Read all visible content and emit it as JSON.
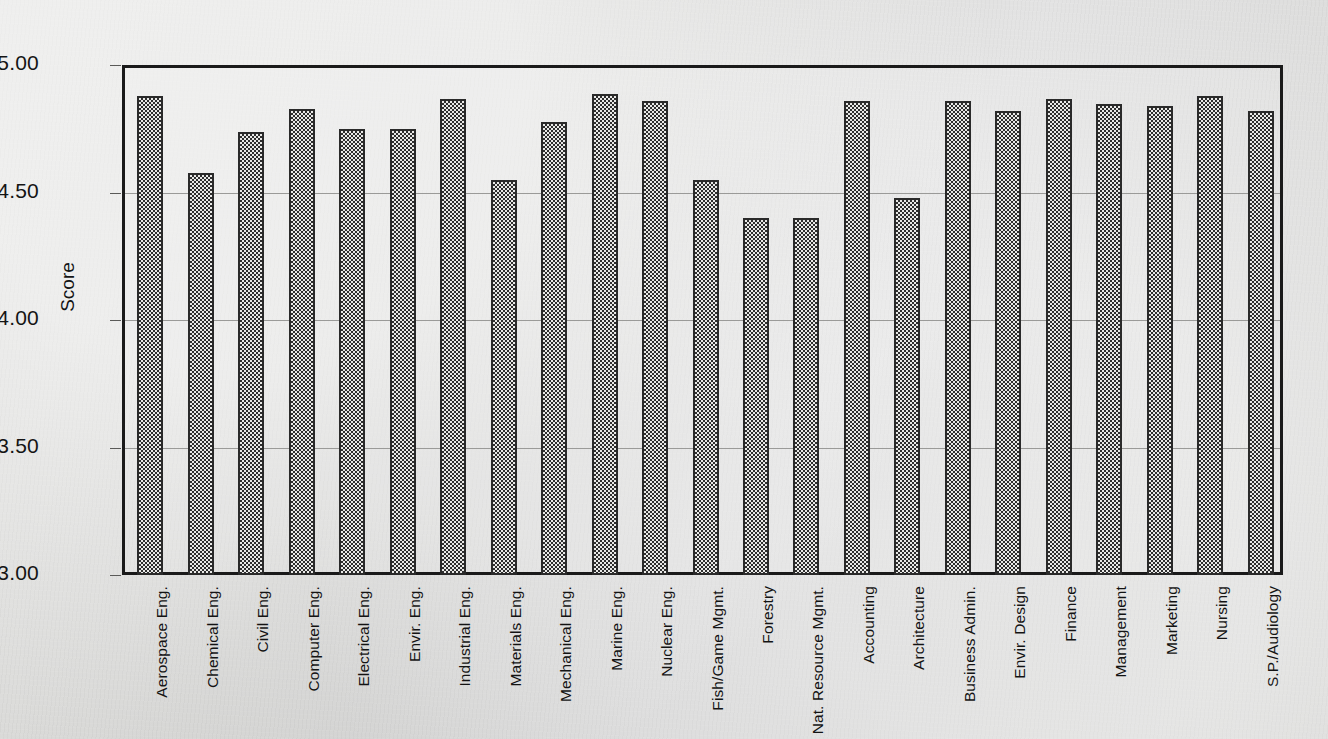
{
  "chart_data": {
    "type": "bar",
    "title": "",
    "subtitle": "",
    "xlabel": "",
    "ylabel": "Score",
    "ylim": [
      3.0,
      5.0
    ],
    "ytick_labels": [
      "5.00",
      "4.50",
      "4.00",
      "3.50",
      "3.00"
    ],
    "ytick_values": [
      5.0,
      4.5,
      4.0,
      3.5,
      3.0
    ],
    "grid": "horizontal",
    "legend": "none",
    "bar_fill": "checkerboard-dither",
    "bar_border_color": "#2a2a2a",
    "categories": [
      "Aerospace Eng.",
      "Chemical Eng.",
      "Civil Eng.",
      "Computer Eng.",
      "Electrical Eng.",
      "Envir. Eng.",
      "Industrial Eng.",
      "Materials  Eng.",
      "Mechanical Eng.",
      "Marine Eng.",
      "Nuclear Eng.",
      "Fish/Game Mgmt.",
      "Forestry",
      "Nat. Resource Mgmt.",
      "Accounting",
      "Architecture",
      "Business Admin.",
      "Envir. Design",
      "Finance",
      "Management",
      "Marketing",
      "Nursing",
      "S.P./Audiology"
    ],
    "values": [
      4.89,
      4.59,
      4.75,
      4.84,
      4.76,
      4.76,
      4.88,
      4.56,
      4.79,
      4.9,
      4.87,
      4.56,
      4.41,
      4.41,
      4.87,
      4.49,
      4.87,
      4.83,
      4.88,
      4.86,
      4.85,
      4.89,
      4.83
    ]
  }
}
